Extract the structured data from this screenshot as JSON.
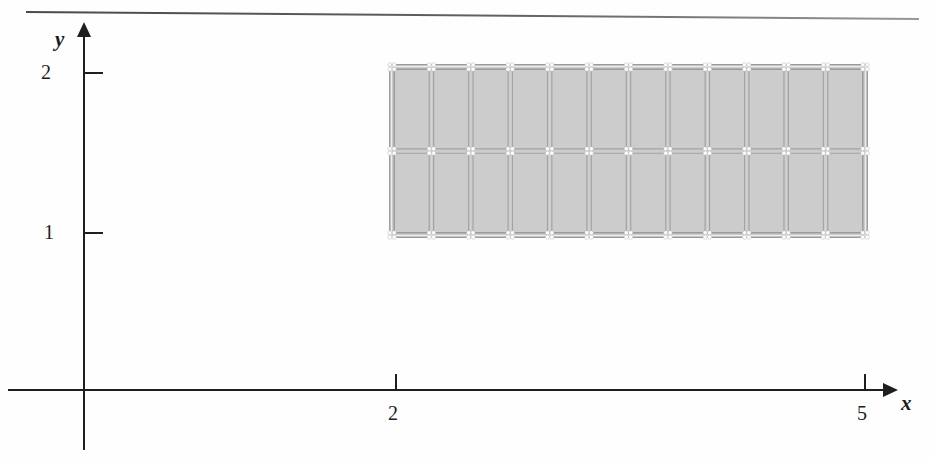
{
  "figure": {
    "kind": "finite-element-mesh-plot",
    "background": "#fefefe",
    "top_rule": {
      "present": true,
      "color": "#555555"
    }
  },
  "axes": {
    "x": {
      "label": "x",
      "arrow": true,
      "pixel_origin": 83,
      "ticks": [
        {
          "value": "2",
          "px": 395
        },
        {
          "value": "5",
          "px": 864
        }
      ]
    },
    "y": {
      "label": "y",
      "arrow": true,
      "pixel_origin": 389,
      "ticks": [
        {
          "value": "1",
          "px": 232
        },
        {
          "value": "2",
          "px": 72
        }
      ]
    }
  },
  "chart_data": {
    "type": "mesh",
    "title": "",
    "xlabel": "x",
    "ylabel": "y",
    "xlim": [
      0,
      5
    ],
    "ylim": [
      0,
      2
    ],
    "xticks": [
      2,
      5
    ],
    "yticks": [
      1,
      2
    ],
    "grid": false,
    "legend": null,
    "domain": {
      "x_min": 2,
      "x_max": 5,
      "y_min": 1,
      "y_max": 2,
      "shape": "rectangle"
    },
    "mesh": {
      "columns": 12,
      "rows": 2,
      "nodes_x": 13,
      "nodes_y": 3,
      "element_fill": "#c9c9c9",
      "element_edge": "#a2a2a2",
      "node_marker": "#ffffff",
      "doubled_edges": true,
      "x_nodes": [
        2.0,
        2.25,
        2.5,
        2.75,
        3.0,
        3.25,
        3.5,
        3.75,
        4.0,
        4.25,
        4.5,
        4.75,
        5.0
      ],
      "y_nodes": [
        1.0,
        1.5,
        2.0
      ]
    },
    "pixel_box": {
      "left": 392,
      "top": 67,
      "right": 865,
      "bottom": 235
    }
  },
  "colors": {
    "axis": "#1f1f1f",
    "mesh_fill": "#c9c9c9",
    "mesh_line": "#a2a2a2",
    "node": "#fdfdfd"
  }
}
